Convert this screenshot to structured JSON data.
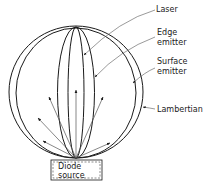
{
  "diagram": {
    "type": "radiation-pattern",
    "labels": {
      "laser": "Laser",
      "edge_emitter_line1": "Edge",
      "edge_emitter_line2": "emitter",
      "surface_emitter_line1": "Surface",
      "surface_emitter_line2": "emitter",
      "lambertian": "Lambertian",
      "source_line1": "Diode",
      "source_line2": "source"
    },
    "colors": {
      "line": "#1a1a1a",
      "arrow": "#555555",
      "background": "#ffffff"
    }
  }
}
